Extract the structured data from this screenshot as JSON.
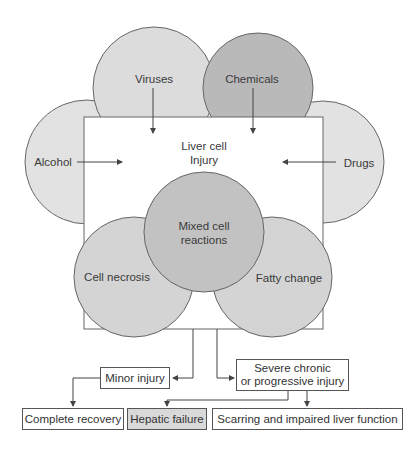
{
  "diagram": {
    "causes": [
      {
        "label": "Viruses",
        "color": "#dcdcdc"
      },
      {
        "label": "Chemicals",
        "color": "#b9b9b9"
      },
      {
        "label": "Alcohol",
        "color": "#e2e2e2"
      },
      {
        "label": "Drugs",
        "color": "#e2e2e2"
      }
    ],
    "center": {
      "line1": "Liver cell",
      "line2": "Injury"
    },
    "reactions": [
      {
        "label_line1": "Mixed cell",
        "label_line2": "reactions",
        "color": "#c2c2c2"
      },
      {
        "label": "Cell necrosis",
        "color": "#d4d4d4"
      },
      {
        "label": "Fatty change",
        "color": "#d4d4d4"
      }
    ],
    "outcomes": {
      "minor": "Minor injury",
      "severe_line1": "Severe chronic",
      "severe_line2": "or progressive injury",
      "complete_recovery": "Complete recovery",
      "hepatic_failure": "Hepatic failure",
      "scarring": "Scarring and impaired liver function"
    },
    "colors": {
      "stroke": "#555555",
      "box_fill": "#ffffff",
      "highlight_fill": "#d9d9d9"
    }
  }
}
